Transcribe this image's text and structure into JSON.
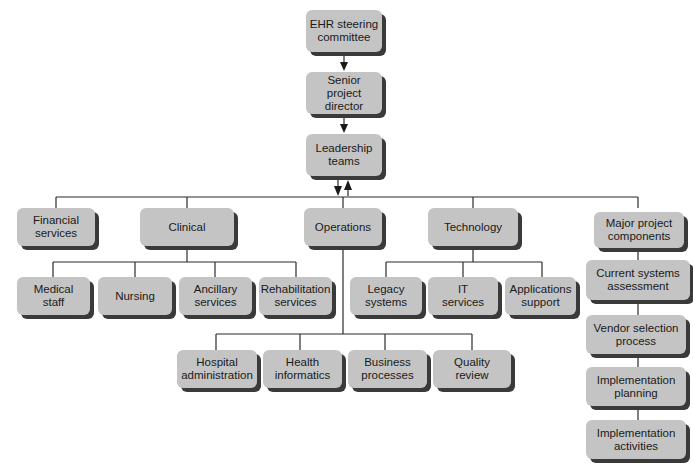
{
  "diagram": {
    "type": "org-chart",
    "title": "",
    "top_chain": [
      {
        "id": "ehr",
        "label": "EHR steering committee",
        "line1": "EHR steering",
        "line2": "committee"
      },
      {
        "id": "spd",
        "label": "Senior project director",
        "line1": "Senior project",
        "line2": "director"
      },
      {
        "id": "lt",
        "label": "Leadership teams",
        "line1": "Leadership",
        "line2": "teams"
      }
    ],
    "divisions": [
      {
        "id": "fin",
        "line1": "Financial",
        "line2": "services",
        "children": []
      },
      {
        "id": "clin",
        "line1": "Clinical",
        "line2": "",
        "children": [
          {
            "line1": "Medical",
            "line2": "staff"
          },
          {
            "line1": "Nursing",
            "line2": ""
          },
          {
            "line1": "Ancillary",
            "line2": "services"
          },
          {
            "line1": "Rehabilitation",
            "line2": "services"
          }
        ]
      },
      {
        "id": "ops",
        "line1": "Operations",
        "line2": "",
        "children": [
          {
            "line1": "Hospital",
            "line2": "administration"
          },
          {
            "line1": "Health",
            "line2": "informatics"
          },
          {
            "line1": "Business",
            "line2": "processes"
          },
          {
            "line1": "Quality",
            "line2": "review"
          }
        ]
      },
      {
        "id": "tech",
        "line1": "Technology",
        "line2": "",
        "children": [
          {
            "line1": "Legacy",
            "line2": "systems"
          },
          {
            "line1": "IT",
            "line2": "services"
          },
          {
            "line1": "Applications",
            "line2": "support"
          }
        ]
      },
      {
        "id": "major",
        "line1": "Major project",
        "line2": "components",
        "children": [
          {
            "line1": "Current systems",
            "line2": "assessment"
          },
          {
            "line1": "Vendor selection",
            "line2": "process"
          },
          {
            "line1": "Implementation",
            "line2": "planning"
          },
          {
            "line1": "Implementation",
            "line2": "activities"
          }
        ]
      }
    ],
    "edges": [
      {
        "from": "EHR steering committee",
        "to": "Senior project director",
        "arrow": "down"
      },
      {
        "from": "Senior project director",
        "to": "Leadership teams",
        "arrow": "down"
      },
      {
        "from": "Leadership teams",
        "to": "divisions",
        "arrow": "down"
      },
      {
        "from": "divisions",
        "to": "Leadership teams",
        "arrow": "up"
      }
    ],
    "colors": {
      "box_fill": "#c4c4c4",
      "box_shadow": "#3a3a3a",
      "line": "#2a2a2a",
      "text": "#1a1a1a",
      "background": "#ffffff"
    }
  }
}
